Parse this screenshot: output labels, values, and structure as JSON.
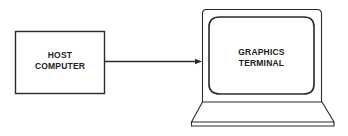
{
  "diagram": {
    "host": {
      "line1": "HOST",
      "line2": "COMPUTER"
    },
    "terminal": {
      "line1": "GRAPHICS",
      "line2": "TERMINAL"
    },
    "connection": {
      "from": "host",
      "to": "terminal",
      "type": "arrow"
    },
    "stroke_color": "#2a2a2a"
  }
}
